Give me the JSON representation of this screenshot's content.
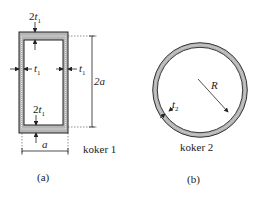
{
  "figure_a": {
    "top_thickness": {
      "coef": "2",
      "var": "t",
      "sub": "1"
    },
    "bottom_thickness": {
      "coef": "2",
      "var": "t",
      "sub": "1"
    },
    "left_thickness": {
      "var": "t",
      "sub": "1"
    },
    "right_thickness": {
      "var": "t",
      "sub": "1"
    },
    "height_dim": "2a",
    "width_dim": "a",
    "name": "koker 1",
    "caption": "(a)"
  },
  "figure_b": {
    "thickness": {
      "var": "t",
      "sub": "2"
    },
    "radius": "R",
    "name": "koker 2",
    "caption": "(b)"
  },
  "colors": {
    "wall_fill": "#b5b5b5",
    "line": "#222222",
    "dotted": "#f2f2f2"
  }
}
